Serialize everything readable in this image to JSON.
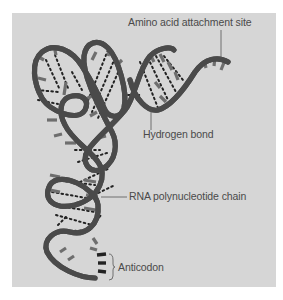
{
  "figure": {
    "colors": {
      "panel_background": "#d6d6d6",
      "strand": "#6e6e6e",
      "strand_edge": "#4a4a4a",
      "base_bar": "#6e6e6e",
      "anticodon_bar": "#222222",
      "hydrogen_bond_dots": "#222222",
      "label_text": "#4a4a4a"
    }
  },
  "labels": {
    "amino_acid_site": "Amino acid attachment site",
    "hydrogen_bond": "Hydrogen bond",
    "rna_chain": "RNA polynucleotide chain",
    "anticodon": "Anticodon"
  }
}
